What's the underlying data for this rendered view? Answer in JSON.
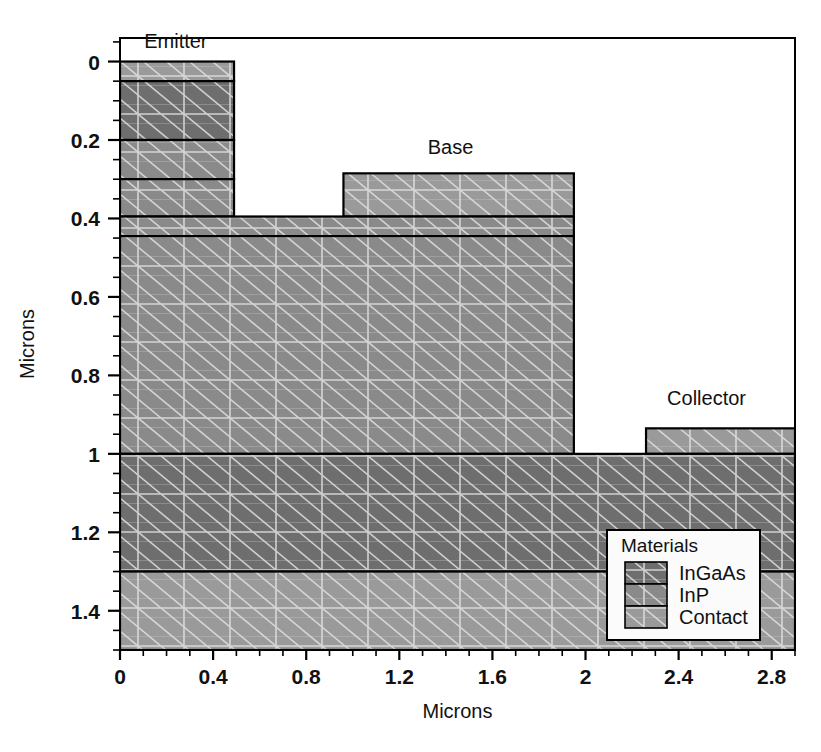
{
  "chart_data": {
    "type": "area",
    "title": "",
    "xlabel": "Microns",
    "ylabel": "Microns",
    "xlim": [
      0,
      2.9
    ],
    "ylim": [
      1.5,
      -0.06
    ],
    "y_inverted": true,
    "grid": false,
    "xticks": [
      0,
      0.4,
      0.8,
      1.2,
      1.6,
      2,
      2.4,
      2.8
    ],
    "xticklabels": [
      "0",
      "0.4",
      "0.8",
      "1.2",
      "1.6",
      "2",
      "2.4",
      "2.8"
    ],
    "x_minor_step": 0.1,
    "yticks": [
      0,
      0.2,
      0.4,
      0.6,
      0.8,
      1,
      1.2,
      1.4
    ],
    "yticklabels": [
      "0",
      "0.2",
      "0.4",
      "0.6",
      "0.8",
      "1",
      "1.2",
      "1.4"
    ],
    "y_minor_step": 0.05,
    "legend": {
      "title": "Materials",
      "position": "lower-right",
      "entries": [
        {
          "label": "InGaAs",
          "color": "#6e6e6e"
        },
        {
          "label": "InP",
          "color": "#8a8a8a"
        },
        {
          "label": "Contact",
          "color": "#9a9a9a"
        }
      ]
    },
    "annotations": [
      {
        "text": "Emitter",
        "x": 0.24,
        "y": -0.035
      },
      {
        "text": "Base",
        "x": 1.42,
        "y": 0.235
      },
      {
        "text": "Collector",
        "x": 2.52,
        "y": 0.875
      }
    ],
    "regions": [
      {
        "name": "emitter-contact-cap",
        "material": "Contact",
        "x0": 0.0,
        "x1": 0.49,
        "y0": 0.0,
        "y1": 0.05
      },
      {
        "name": "emitter-ingaas",
        "material": "InGaAs",
        "x0": 0.0,
        "x1": 0.49,
        "y0": 0.05,
        "y1": 0.2
      },
      {
        "name": "emitter-inp-upper",
        "material": "InP",
        "x0": 0.0,
        "x1": 0.49,
        "y0": 0.2,
        "y1": 0.3
      },
      {
        "name": "emitter-inp-lower",
        "material": "InP",
        "x0": 0.0,
        "x1": 0.49,
        "y0": 0.3,
        "y1": 0.395
      },
      {
        "name": "base-contact-pad",
        "material": "Contact",
        "x0": 0.96,
        "x1": 1.95,
        "y0": 0.285,
        "y1": 0.395
      },
      {
        "name": "base-inp-layer",
        "material": "InP",
        "x0": 0.0,
        "x1": 1.95,
        "y0": 0.395,
        "y1": 0.445
      },
      {
        "name": "base-collector-body",
        "material": "InP",
        "x0": 0.0,
        "x1": 1.95,
        "y0": 0.445,
        "y1": 1.0
      },
      {
        "name": "collector-contact-pad",
        "material": "Contact",
        "x0": 2.26,
        "x1": 2.9,
        "y0": 0.935,
        "y1": 1.0
      },
      {
        "name": "subcollector-ingaas",
        "material": "InGaAs",
        "x0": 0.0,
        "x1": 2.9,
        "y0": 1.0,
        "y1": 1.3
      },
      {
        "name": "substrate-contact",
        "material": "Contact",
        "x0": 0.0,
        "x1": 2.9,
        "y0": 1.3,
        "y1": 1.5
      }
    ]
  }
}
